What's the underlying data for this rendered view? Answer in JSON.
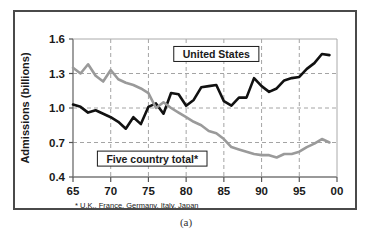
{
  "figure": {
    "caption": "(a)"
  },
  "chart_data": {
    "type": "line",
    "title": "",
    "xlabel": "",
    "ylabel": "Admissions (billions)",
    "xlim": [
      65,
      100
    ],
    "ylim": [
      0.4,
      1.6
    ],
    "grid": true,
    "y_ticks": [
      "1.6",
      "1.3",
      "1.0",
      "0.7",
      "0.4"
    ],
    "y_tick_values": [
      1.6,
      1.3,
      1.0,
      0.7,
      0.4
    ],
    "x_ticks": [
      "65",
      "70",
      "75",
      "80",
      "85",
      "90",
      "95",
      "00"
    ],
    "x_tick_values": [
      65,
      70,
      75,
      80,
      85,
      90,
      95,
      100
    ],
    "footnote": "* U.K., France, Germany, Italy, Japan",
    "legend_position": "inline-annotations",
    "x": [
      65,
      66,
      67,
      68,
      69,
      70,
      71,
      72,
      73,
      74,
      75,
      76,
      77,
      78,
      79,
      80,
      81,
      82,
      83,
      84,
      85,
      86,
      87,
      88,
      89,
      90,
      91,
      92,
      93,
      94,
      95,
      96,
      97,
      98,
      99
    ],
    "series": [
      {
        "name": "United States",
        "color": "#111111",
        "values": [
          1.03,
          1.01,
          0.96,
          0.98,
          0.95,
          0.92,
          0.88,
          0.82,
          0.92,
          0.86,
          1.01,
          1.04,
          0.95,
          1.13,
          1.12,
          1.02,
          1.07,
          1.18,
          1.19,
          1.2,
          1.06,
          1.02,
          1.09,
          1.09,
          1.26,
          1.19,
          1.14,
          1.17,
          1.24,
          1.26,
          1.27,
          1.34,
          1.39,
          1.47,
          1.46
        ]
      },
      {
        "name": "Five country total*",
        "color": "#9a9a9a",
        "values": [
          1.35,
          1.3,
          1.38,
          1.28,
          1.23,
          1.33,
          1.25,
          1.22,
          1.2,
          1.17,
          1.13,
          1.0,
          1.05,
          1.0,
          0.96,
          0.92,
          0.88,
          0.85,
          0.8,
          0.78,
          0.73,
          0.66,
          0.64,
          0.62,
          0.6,
          0.59,
          0.59,
          0.57,
          0.6,
          0.6,
          0.62,
          0.66,
          0.69,
          0.73,
          0.7
        ]
      }
    ],
    "annotations": [
      {
        "name": "united-states-label",
        "text": "United States",
        "x": 84,
        "y": 1.47
      },
      {
        "name": "five-country-label",
        "text": "Five country total*",
        "x": 75.5,
        "y": 0.56
      }
    ]
  }
}
